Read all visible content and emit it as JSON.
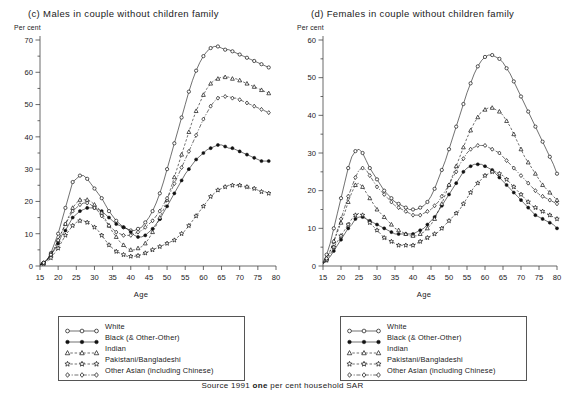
{
  "source_note": {
    "pre": "Source 1991 ",
    "emphasis": "one",
    "post": " per cent household SAR"
  },
  "legend": {
    "entries": [
      {
        "label": "White",
        "marker": "open-circle",
        "dash": "solid",
        "name": "white"
      },
      {
        "label": "Black (& Other-Other)",
        "marker": "filled-circle",
        "dash": "solid",
        "name": "black"
      },
      {
        "label": "Indian",
        "marker": "open-triangle",
        "dash": "dashed",
        "name": "indian"
      },
      {
        "label": "Pakistani/Bangladeshi",
        "marker": "open-star",
        "dash": "dashed",
        "name": "pakistani"
      },
      {
        "label": "Other Asian (including Chinese)",
        "marker": "open-diamond",
        "dash": "dashdot",
        "name": "other-asian"
      }
    ]
  },
  "chart_data": [
    {
      "panel": "c",
      "type": "line",
      "title": "(c) Males in couple without children family",
      "ylabel": "Per cent",
      "xlabel": "Age",
      "xlim": [
        15,
        80
      ],
      "ylim": [
        0,
        70
      ],
      "xticks": [
        15,
        20,
        25,
        30,
        35,
        40,
        45,
        50,
        55,
        60,
        65,
        70,
        75,
        80
      ],
      "yticks": [
        0,
        10,
        20,
        30,
        40,
        50,
        60,
        70
      ],
      "grid": false,
      "legend_position": "below",
      "x": [
        15,
        16,
        17,
        18,
        19,
        20,
        21,
        22,
        23,
        24,
        25,
        26,
        27,
        28,
        29,
        30,
        31,
        32,
        33,
        34,
        35,
        36,
        37,
        38,
        39,
        40,
        41,
        42,
        43,
        44,
        45,
        46,
        47,
        48,
        49,
        50,
        51,
        52,
        53,
        54,
        55,
        56,
        57,
        58,
        59,
        60,
        61,
        62,
        63,
        64,
        65,
        66,
        67,
        68,
        69,
        70,
        71,
        72,
        73,
        74,
        75,
        76,
        77,
        78
      ],
      "series": [
        {
          "name": "White",
          "marker": "open-circle",
          "dash": "solid",
          "values": [
            0.5,
            1,
            2,
            4,
            7,
            10,
            14,
            18,
            22,
            26,
            27,
            28,
            28,
            27,
            25.5,
            24,
            22.5,
            21,
            19,
            17,
            15.5,
            14,
            13,
            12,
            11.5,
            11,
            11,
            11.5,
            12,
            13.5,
            15,
            17,
            19.5,
            22.5,
            26,
            30,
            34,
            38,
            42,
            46,
            50,
            54,
            57.5,
            60.5,
            63,
            65,
            66.5,
            67.5,
            68,
            68,
            67.5,
            67,
            67,
            66.5,
            66,
            65.5,
            65,
            64.5,
            64,
            63.5,
            63,
            62.5,
            62,
            61.5
          ]
        },
        {
          "name": "Black (& Other-Other)",
          "marker": "filled-circle",
          "dash": "solid",
          "values": [
            0.5,
            1,
            2,
            3.5,
            5,
            7,
            9.5,
            11,
            13,
            15,
            16,
            17,
            17.5,
            18,
            18,
            18,
            17.5,
            17,
            16,
            15,
            14,
            13,
            12.5,
            12,
            11.5,
            10.5,
            9.5,
            9,
            9,
            9.5,
            10.5,
            11.5,
            13,
            14.5,
            16.5,
            18.5,
            20.5,
            22.5,
            24.5,
            26.5,
            28.5,
            30,
            31.5,
            33,
            34,
            35,
            36,
            36.5,
            37,
            37.5,
            37.5,
            37,
            36.5,
            36.5,
            36,
            35.5,
            35,
            34.5,
            34,
            33.5,
            33,
            32.5,
            32.5,
            32.5
          ]
        },
        {
          "name": "Indian",
          "marker": "open-triangle",
          "dash": "dashed",
          "values": [
            0.3,
            0.8,
            1.8,
            3.5,
            5.5,
            8,
            10.5,
            13,
            15.5,
            18,
            19.5,
            20.5,
            20.5,
            20.5,
            20,
            19,
            18,
            16.5,
            14.5,
            12.5,
            10.5,
            9,
            7.5,
            6.5,
            5.5,
            5,
            5,
            5.5,
            6,
            7,
            8.5,
            10.5,
            12.5,
            15,
            17.5,
            20.5,
            24,
            27.5,
            31,
            34.5,
            38,
            41.5,
            45,
            48,
            50.5,
            53,
            55,
            56.5,
            57.5,
            58,
            58.5,
            58.5,
            58.5,
            58,
            58,
            57.5,
            57,
            56.5,
            56,
            55.5,
            55,
            54.5,
            54,
            53.5
          ]
        },
        {
          "name": "Pakistani/Bangladeshi",
          "marker": "open-star",
          "dash": "dashed",
          "values": [
            0.3,
            0.8,
            1.5,
            2.5,
            4,
            5.5,
            7.5,
            9.5,
            11,
            12.5,
            13.5,
            14,
            14,
            13.5,
            13,
            12,
            11,
            9.5,
            8,
            6.5,
            5.5,
            4.5,
            4,
            3.5,
            3,
            3,
            3,
            3.2,
            3.5,
            4,
            4.5,
            5,
            5.5,
            6,
            6.5,
            7,
            7.5,
            8,
            9,
            10,
            11,
            12.5,
            14,
            15.5,
            17,
            18.5,
            20,
            21.5,
            22.5,
            23.5,
            24,
            24.5,
            25,
            25,
            25,
            25,
            24.5,
            24.5,
            24,
            24,
            23.5,
            23,
            23,
            22.5
          ]
        },
        {
          "name": "Other Asian (including Chinese)",
          "marker": "open-diamond",
          "dash": "dashdot",
          "values": [
            0.4,
            1,
            2,
            3.5,
            5.5,
            8,
            10.5,
            13,
            15,
            17,
            18,
            19,
            19.5,
            19.5,
            19,
            18,
            17,
            15.5,
            14,
            12.5,
            11.5,
            10.5,
            10,
            9.5,
            9.5,
            9.5,
            10,
            10.5,
            11,
            12,
            13,
            14,
            15.5,
            17,
            19,
            21,
            23,
            25.5,
            28,
            30.5,
            33,
            35.5,
            38,
            40.5,
            43,
            45.5,
            47.5,
            49.5,
            51,
            52,
            52.5,
            52.5,
            52.5,
            52,
            52,
            51.5,
            51,
            50.5,
            50,
            49.5,
            49,
            48.5,
            48,
            47.5
          ]
        }
      ]
    },
    {
      "panel": "d",
      "type": "line",
      "title": "(d) Females in couple without children family",
      "ylabel": "Per cent",
      "xlabel": "Age",
      "xlim": [
        15,
        80
      ],
      "ylim": [
        0,
        60
      ],
      "xticks": [
        15,
        20,
        25,
        30,
        35,
        40,
        45,
        50,
        55,
        60,
        65,
        70,
        75,
        80
      ],
      "yticks": [
        0,
        10,
        20,
        30,
        40,
        50,
        60
      ],
      "grid": false,
      "legend_position": "below",
      "x": [
        15,
        16,
        17,
        18,
        19,
        20,
        21,
        22,
        23,
        24,
        25,
        26,
        27,
        28,
        29,
        30,
        31,
        32,
        33,
        34,
        35,
        36,
        37,
        38,
        39,
        40,
        41,
        42,
        43,
        44,
        45,
        46,
        47,
        48,
        49,
        50,
        51,
        52,
        53,
        54,
        55,
        56,
        57,
        58,
        59,
        60,
        61,
        62,
        63,
        64,
        65,
        66,
        67,
        68,
        69,
        70,
        71,
        72,
        73,
        74,
        75,
        76,
        77,
        78,
        79,
        80
      ],
      "series": [
        {
          "name": "White",
          "marker": "open-circle",
          "dash": "solid",
          "values": [
            1,
            3,
            6,
            10,
            14,
            18,
            22,
            26,
            29,
            30.5,
            31,
            30,
            28,
            26,
            24.5,
            23,
            21.5,
            20,
            19,
            18,
            17,
            16.5,
            16,
            15.5,
            15,
            15,
            15,
            15.5,
            16,
            17,
            18.5,
            20.5,
            23,
            25.5,
            28,
            31,
            34,
            37,
            40,
            43,
            46,
            48.5,
            51,
            53,
            54.5,
            55.5,
            56,
            56,
            55.5,
            55,
            54,
            52.5,
            51,
            49,
            47,
            45,
            43,
            41,
            39,
            37,
            35,
            33,
            31,
            29,
            27,
            24.5
          ]
        },
        {
          "name": "Black (& Other-Other)",
          "marker": "filled-circle",
          "dash": "solid",
          "values": [
            0.5,
            1.5,
            2.5,
            4,
            5.5,
            7,
            8.5,
            10,
            11,
            12.5,
            13,
            13,
            12.5,
            12,
            11.5,
            11,
            10.5,
            10,
            9.5,
            9,
            8.5,
            8.5,
            8.5,
            8.5,
            8.5,
            8.5,
            9,
            9.5,
            10,
            11,
            12,
            13,
            14.5,
            16,
            17.5,
            19,
            20.5,
            22,
            23.5,
            25,
            26,
            26.5,
            27,
            27,
            27,
            26.5,
            26,
            25.5,
            24.5,
            23.5,
            22.5,
            21.5,
            20.5,
            19.5,
            18.5,
            17.5,
            16.5,
            15.5,
            14.5,
            13.5,
            13,
            12.5,
            12,
            11.5,
            11,
            10
          ]
        },
        {
          "name": "Indian",
          "marker": "open-triangle",
          "dash": "dashed",
          "values": [
            0.8,
            2,
            4,
            6.5,
            9,
            11.5,
            14,
            17,
            19.5,
            21.5,
            22,
            21,
            19.5,
            18,
            16.5,
            15,
            14,
            13,
            12,
            11,
            10,
            9.5,
            9,
            8.5,
            8,
            8,
            8,
            8.5,
            9,
            10,
            11,
            12.5,
            14.5,
            16.5,
            19,
            21.5,
            24,
            26.5,
            29,
            31.5,
            34,
            36,
            38,
            39.5,
            41,
            41.5,
            42,
            42,
            41.5,
            41,
            40,
            38.5,
            37,
            35,
            33,
            31,
            29,
            27.5,
            26,
            24.5,
            23,
            21.5,
            20.5,
            19.5,
            18.5,
            17.5
          ]
        },
        {
          "name": "Pakistani/Bangladeshi",
          "marker": "open-star",
          "dash": "dashed",
          "values": [
            0.6,
            1.5,
            3,
            5,
            6.5,
            8,
            9.5,
            11,
            12.5,
            13.5,
            14,
            13.5,
            12.5,
            11.5,
            10.5,
            9.5,
            8.5,
            7.5,
            7,
            6.5,
            6,
            5.5,
            5.5,
            5.5,
            5.5,
            5.5,
            6,
            6.5,
            7,
            7.5,
            8,
            8.5,
            9,
            10,
            11,
            12,
            13,
            14,
            15,
            16.5,
            18,
            19.5,
            21,
            22,
            23,
            24,
            24.5,
            25,
            25,
            24.5,
            24,
            23,
            22,
            21,
            20,
            19,
            18,
            17,
            16,
            15.5,
            15,
            14.5,
            14,
            13.5,
            13,
            12.5
          ]
        },
        {
          "name": "Other Asian (including Chinese)",
          "marker": "open-diamond",
          "dash": "dashdot",
          "values": [
            0.8,
            2,
            4,
            6.5,
            9.5,
            12.5,
            15.5,
            18.5,
            21,
            23.5,
            25.5,
            26,
            25.5,
            24,
            22.5,
            21,
            20,
            19,
            18,
            17,
            16,
            15.5,
            15,
            14.5,
            14,
            13.5,
            13.5,
            13.5,
            14,
            14.5,
            15,
            16,
            17,
            18.5,
            20,
            21.5,
            23.5,
            25,
            27,
            28.5,
            30,
            31,
            31.5,
            32,
            32,
            32,
            31.5,
            31,
            30.5,
            30,
            29,
            28,
            27,
            26,
            25,
            24,
            23,
            22,
            21,
            20,
            19,
            18.5,
            18,
            17.5,
            17,
            16.5
          ]
        }
      ]
    }
  ]
}
